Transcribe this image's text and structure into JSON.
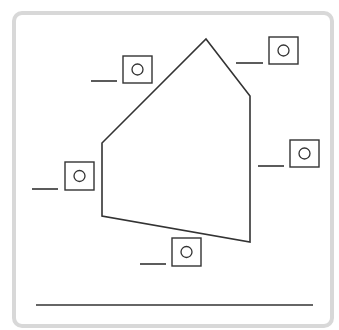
{
  "colors": {
    "frame_border": "#d8d8d8",
    "stroke": "#333333",
    "background": "#ffffff"
  },
  "polygon": {
    "shape": "pentagon",
    "vertices": [
      [
        206,
        39
      ],
      [
        250,
        96
      ],
      [
        250,
        242
      ],
      [
        102,
        216
      ],
      [
        102,
        143
      ]
    ]
  },
  "label_slots": [
    {
      "id": "slot-top-left",
      "box": {
        "x": 123,
        "y": 56,
        "w": 29,
        "h": 27
      },
      "blank": {
        "x1": 91,
        "x2": 117,
        "y": 81
      },
      "value": ""
    },
    {
      "id": "slot-top-right",
      "box": {
        "x": 269,
        "y": 37,
        "w": 29,
        "h": 27
      },
      "blank": {
        "x1": 236,
        "x2": 263,
        "y": 63
      },
      "value": ""
    },
    {
      "id": "slot-right",
      "box": {
        "x": 290,
        "y": 140,
        "w": 29,
        "h": 27
      },
      "blank": {
        "x1": 258,
        "x2": 284,
        "y": 166
      },
      "value": ""
    },
    {
      "id": "slot-left",
      "box": {
        "x": 65,
        "y": 162,
        "w": 29,
        "h": 28
      },
      "blank": {
        "x1": 32,
        "x2": 58,
        "y": 189
      },
      "value": ""
    },
    {
      "id": "slot-bottom",
      "box": {
        "x": 172,
        "y": 238,
        "w": 29,
        "h": 28
      },
      "blank": {
        "x1": 140,
        "x2": 166,
        "y": 264
      },
      "value": ""
    }
  ],
  "answer_line": {
    "x1": 36,
    "x2": 313,
    "y": 305,
    "value": ""
  }
}
